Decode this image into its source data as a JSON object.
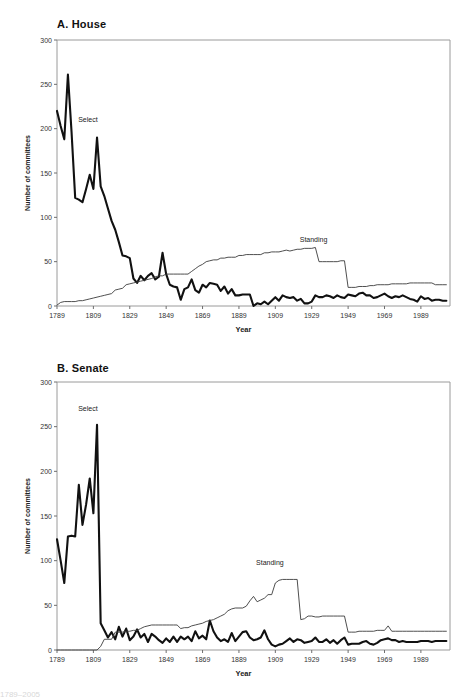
{
  "figure": {
    "background": "#ffffff",
    "select_color": "#111111",
    "standing_color": "#3b3b3b",
    "axis_color": "#9a9a9a"
  },
  "panels": [
    {
      "id": "house",
      "title": "A. House",
      "annotations": [
        {
          "name": "select-label",
          "text": "Select",
          "x": 1806,
          "y": 208
        },
        {
          "name": "standing-label",
          "text": "Standing",
          "x": 1930,
          "y": 72
        }
      ]
    },
    {
      "id": "senate",
      "title": "B. Senate",
      "annotations": [
        {
          "name": "select-label",
          "text": "Select",
          "x": 1806,
          "y": 268
        },
        {
          "name": "standing-label",
          "text": "Standing",
          "x": 1906,
          "y": 95
        }
      ]
    }
  ],
  "caption_sliver": "1789–2005",
  "chart_data": [
    {
      "type": "line",
      "title": "A. House",
      "xlabel": "Year",
      "ylabel": "Number of committees",
      "xlim": [
        1789,
        2005
      ],
      "ylim": [
        0,
        300
      ],
      "yticks": [
        0,
        50,
        100,
        150,
        200,
        250,
        300
      ],
      "xticks": [
        1789,
        1809,
        1829,
        1849,
        1869,
        1889,
        1909,
        1929,
        1949,
        1969,
        1989
      ],
      "grid": false,
      "legend": "inline-annotations",
      "series": [
        {
          "name": "Select",
          "x": [
            1789,
            1791,
            1793,
            1795,
            1797,
            1799,
            1801,
            1803,
            1805,
            1807,
            1809,
            1811,
            1813,
            1815,
            1817,
            1819,
            1821,
            1823,
            1825,
            1827,
            1829,
            1831,
            1833,
            1835,
            1837,
            1839,
            1841,
            1843,
            1845,
            1847,
            1849,
            1851,
            1853,
            1855,
            1857,
            1859,
            1861,
            1863,
            1865,
            1867,
            1869,
            1871,
            1873,
            1875,
            1877,
            1879,
            1881,
            1883,
            1885,
            1887,
            1889,
            1891,
            1893,
            1895,
            1897,
            1899,
            1901,
            1903,
            1905,
            1907,
            1909,
            1911,
            1913,
            1915,
            1917,
            1919,
            1921,
            1923,
            1925,
            1927,
            1929,
            1931,
            1933,
            1935,
            1937,
            1939,
            1941,
            1943,
            1945,
            1947,
            1949,
            1951,
            1953,
            1955,
            1957,
            1959,
            1961,
            1963,
            1965,
            1967,
            1969,
            1971,
            1973,
            1975,
            1977,
            1979,
            1981,
            1983,
            1985,
            1987,
            1989,
            1991,
            1993,
            1995,
            1997,
            1999,
            2001,
            2003
          ],
          "y": [
            220,
            203,
            188,
            261,
            196,
            122,
            120,
            117,
            132,
            148,
            132,
            190,
            135,
            124,
            110,
            96,
            86,
            72,
            57,
            56,
            54,
            31,
            26,
            34,
            29,
            34,
            37,
            30,
            33,
            60,
            36,
            24,
            22,
            21,
            7,
            19,
            21,
            30,
            18,
            15,
            24,
            21,
            26,
            25,
            24,
            17,
            22,
            14,
            19,
            12,
            12,
            13,
            13,
            13,
            0,
            3,
            2,
            5,
            2,
            6,
            10,
            6,
            12,
            10,
            9,
            10,
            6,
            8,
            3,
            3,
            5,
            12,
            10,
            10,
            12,
            11,
            9,
            12,
            10,
            9,
            13,
            12,
            11,
            14,
            15,
            12,
            12,
            9,
            10,
            12,
            14,
            11,
            9,
            11,
            10,
            12,
            10,
            8,
            7,
            5,
            11,
            8,
            9,
            6,
            7,
            7,
            6,
            6
          ]
        },
        {
          "name": "Standing",
          "x": [
            1789,
            1791,
            1793,
            1795,
            1797,
            1799,
            1801,
            1803,
            1805,
            1807,
            1809,
            1811,
            1813,
            1815,
            1817,
            1819,
            1821,
            1823,
            1825,
            1827,
            1829,
            1831,
            1833,
            1835,
            1837,
            1839,
            1841,
            1843,
            1845,
            1847,
            1849,
            1851,
            1853,
            1855,
            1857,
            1859,
            1861,
            1863,
            1865,
            1867,
            1869,
            1871,
            1873,
            1875,
            1877,
            1879,
            1881,
            1883,
            1885,
            1887,
            1889,
            1891,
            1893,
            1895,
            1897,
            1899,
            1901,
            1903,
            1905,
            1907,
            1909,
            1911,
            1913,
            1915,
            1917,
            1919,
            1921,
            1923,
            1925,
            1927,
            1929,
            1931,
            1933,
            1935,
            1937,
            1939,
            1941,
            1943,
            1945,
            1947,
            1949,
            1951,
            1953,
            1955,
            1957,
            1959,
            1961,
            1963,
            1965,
            1967,
            1969,
            1971,
            1973,
            1975,
            1977,
            1979,
            1981,
            1983,
            1985,
            1987,
            1989,
            1991,
            1993,
            1995,
            1997,
            1999,
            2001,
            2003
          ],
          "y": [
            1,
            4,
            5,
            5,
            5,
            5,
            6,
            6,
            7,
            8,
            9,
            10,
            11,
            12,
            13,
            14,
            18,
            19,
            20,
            24,
            25,
            26,
            27,
            28,
            29,
            30,
            31,
            33,
            34,
            34,
            36,
            36,
            36,
            36,
            36,
            36,
            36,
            39,
            42,
            45,
            47,
            50,
            51,
            52,
            52,
            54,
            54,
            55,
            55,
            55,
            57,
            57,
            58,
            58,
            58,
            58,
            58,
            60,
            60,
            61,
            61,
            61,
            62,
            63,
            62,
            63,
            64,
            64,
            65,
            65,
            65,
            66,
            50,
            50,
            50,
            50,
            50,
            50,
            51,
            51,
            21,
            21,
            21,
            22,
            22,
            22,
            23,
            23,
            24,
            24,
            24,
            24,
            25,
            25,
            25,
            25,
            25,
            26,
            26,
            26,
            26,
            26,
            26,
            26,
            24,
            24,
            24,
            24
          ]
        }
      ]
    },
    {
      "type": "line",
      "title": "B. Senate",
      "xlabel": "Year",
      "ylabel": "Number of committees",
      "xlim": [
        1789,
        2005
      ],
      "ylim": [
        0,
        300
      ],
      "yticks": [
        0,
        50,
        100,
        150,
        200,
        250,
        300
      ],
      "xticks": [
        1789,
        1809,
        1829,
        1849,
        1869,
        1889,
        1909,
        1929,
        1949,
        1969,
        1989
      ],
      "grid": false,
      "legend": "inline-annotations",
      "series": [
        {
          "name": "Select",
          "x": [
            1789,
            1791,
            1793,
            1795,
            1797,
            1799,
            1801,
            1803,
            1805,
            1807,
            1809,
            1811,
            1813,
            1815,
            1817,
            1819,
            1821,
            1823,
            1825,
            1827,
            1829,
            1831,
            1833,
            1835,
            1837,
            1839,
            1841,
            1843,
            1845,
            1847,
            1849,
            1851,
            1853,
            1855,
            1857,
            1859,
            1861,
            1863,
            1865,
            1867,
            1869,
            1871,
            1873,
            1875,
            1877,
            1879,
            1881,
            1883,
            1885,
            1887,
            1889,
            1891,
            1893,
            1895,
            1897,
            1899,
            1901,
            1903,
            1905,
            1907,
            1909,
            1911,
            1913,
            1915,
            1917,
            1919,
            1921,
            1923,
            1925,
            1927,
            1929,
            1931,
            1933,
            1935,
            1937,
            1939,
            1941,
            1943,
            1945,
            1947,
            1949,
            1951,
            1953,
            1955,
            1957,
            1959,
            1961,
            1963,
            1965,
            1967,
            1969,
            1971,
            1973,
            1975,
            1977,
            1979,
            1981,
            1983,
            1985,
            1987,
            1989,
            1991,
            1993,
            1995,
            1997,
            1999,
            2001,
            2003
          ],
          "y": [
            124,
            100,
            75,
            127,
            128,
            127,
            185,
            140,
            163,
            192,
            153,
            252,
            30,
            22,
            14,
            20,
            12,
            26,
            15,
            24,
            11,
            15,
            23,
            14,
            18,
            9,
            18,
            15,
            11,
            8,
            13,
            9,
            15,
            9,
            15,
            12,
            15,
            10,
            21,
            13,
            16,
            12,
            33,
            21,
            14,
            10,
            12,
            9,
            19,
            10,
            15,
            20,
            21,
            14,
            11,
            12,
            14,
            22,
            12,
            6,
            4,
            6,
            7,
            10,
            13,
            9,
            12,
            11,
            8,
            9,
            10,
            14,
            9,
            9,
            12,
            8,
            11,
            7,
            11,
            14,
            6,
            7,
            7,
            7,
            9,
            10,
            7,
            6,
            8,
            11,
            12,
            13,
            11,
            11,
            9,
            10,
            9,
            9,
            9,
            9,
            10,
            10,
            10,
            9,
            10,
            10,
            10,
            10
          ]
        },
        {
          "name": "Standing",
          "x": [
            1789,
            1791,
            1793,
            1795,
            1797,
            1799,
            1801,
            1803,
            1805,
            1807,
            1809,
            1811,
            1813,
            1815,
            1817,
            1819,
            1821,
            1823,
            1825,
            1827,
            1829,
            1831,
            1833,
            1835,
            1837,
            1839,
            1841,
            1843,
            1845,
            1847,
            1849,
            1851,
            1853,
            1855,
            1857,
            1859,
            1861,
            1863,
            1865,
            1867,
            1869,
            1871,
            1873,
            1875,
            1877,
            1879,
            1881,
            1883,
            1885,
            1887,
            1889,
            1891,
            1893,
            1895,
            1897,
            1899,
            1901,
            1903,
            1905,
            1907,
            1909,
            1911,
            1913,
            1915,
            1917,
            1919,
            1921,
            1923,
            1925,
            1927,
            1929,
            1931,
            1933,
            1935,
            1937,
            1939,
            1941,
            1943,
            1945,
            1947,
            1949,
            1951,
            1953,
            1955,
            1957,
            1959,
            1961,
            1963,
            1965,
            1967,
            1969,
            1971,
            1973,
            1975,
            1977,
            1979,
            1981,
            1983,
            1985,
            1987,
            1989,
            1991,
            1993,
            1995,
            1997,
            1999,
            2001,
            2003
          ],
          "y": [
            0,
            0,
            0,
            0,
            0,
            0,
            0,
            0,
            0,
            0,
            0,
            0,
            4,
            12,
            12,
            12,
            20,
            20,
            20,
            21,
            21,
            22,
            22,
            24,
            26,
            27,
            28,
            28,
            28,
            28,
            28,
            28,
            28,
            28,
            24,
            25,
            25,
            27,
            28,
            29,
            30,
            32,
            33,
            34,
            36,
            38,
            40,
            44,
            46,
            47,
            47,
            47,
            49,
            55,
            60,
            54,
            56,
            58,
            62,
            62,
            75,
            78,
            79,
            79,
            79,
            79,
            79,
            34,
            35,
            38,
            38,
            37,
            37,
            38,
            38,
            38,
            38,
            38,
            38,
            38,
            20,
            20,
            20,
            21,
            21,
            21,
            21,
            21,
            22,
            22,
            22,
            27,
            21,
            21,
            21,
            21,
            21,
            21,
            21,
            21,
            21,
            21,
            21,
            21,
            21,
            21,
            21,
            21
          ]
        }
      ]
    }
  ]
}
